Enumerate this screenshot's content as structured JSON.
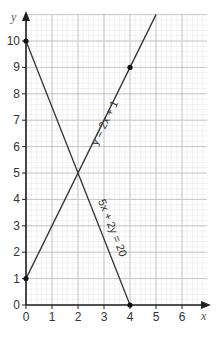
{
  "chart_data": {
    "type": "line",
    "title": "",
    "xlabel": "x",
    "ylabel": "y",
    "xlim": [
      0,
      7
    ],
    "ylim": [
      0,
      11
    ],
    "x_ticks": [
      "0",
      "1",
      "2",
      "3",
      "4",
      "5",
      "6"
    ],
    "y_ticks": [
      "0",
      "1",
      "2",
      "3",
      "4",
      "5",
      "6",
      "7",
      "8",
      "9",
      "10"
    ],
    "grid": {
      "major": 1,
      "minor": 0.2,
      "on": true
    },
    "series": [
      {
        "name": "y = 2x + 1",
        "equation": "y = 2x + 1",
        "x": [
          0,
          4,
          5
        ],
        "y": [
          1,
          9,
          11
        ],
        "marked_points": [
          [
            0,
            1
          ],
          [
            4,
            9
          ]
        ]
      },
      {
        "name": "5x + 2y = 20",
        "equation": "5x + 2y = 20",
        "x": [
          0,
          4
        ],
        "y": [
          10,
          0
        ],
        "marked_points": [
          [
            0,
            10
          ],
          [
            4,
            0
          ]
        ]
      }
    ],
    "intersection": [
      2,
      5
    ],
    "colors": {
      "line": "#333333",
      "major_grid": "#bbbbbb",
      "minor_grid": "#e4e4e4",
      "axis": "#222222"
    }
  }
}
